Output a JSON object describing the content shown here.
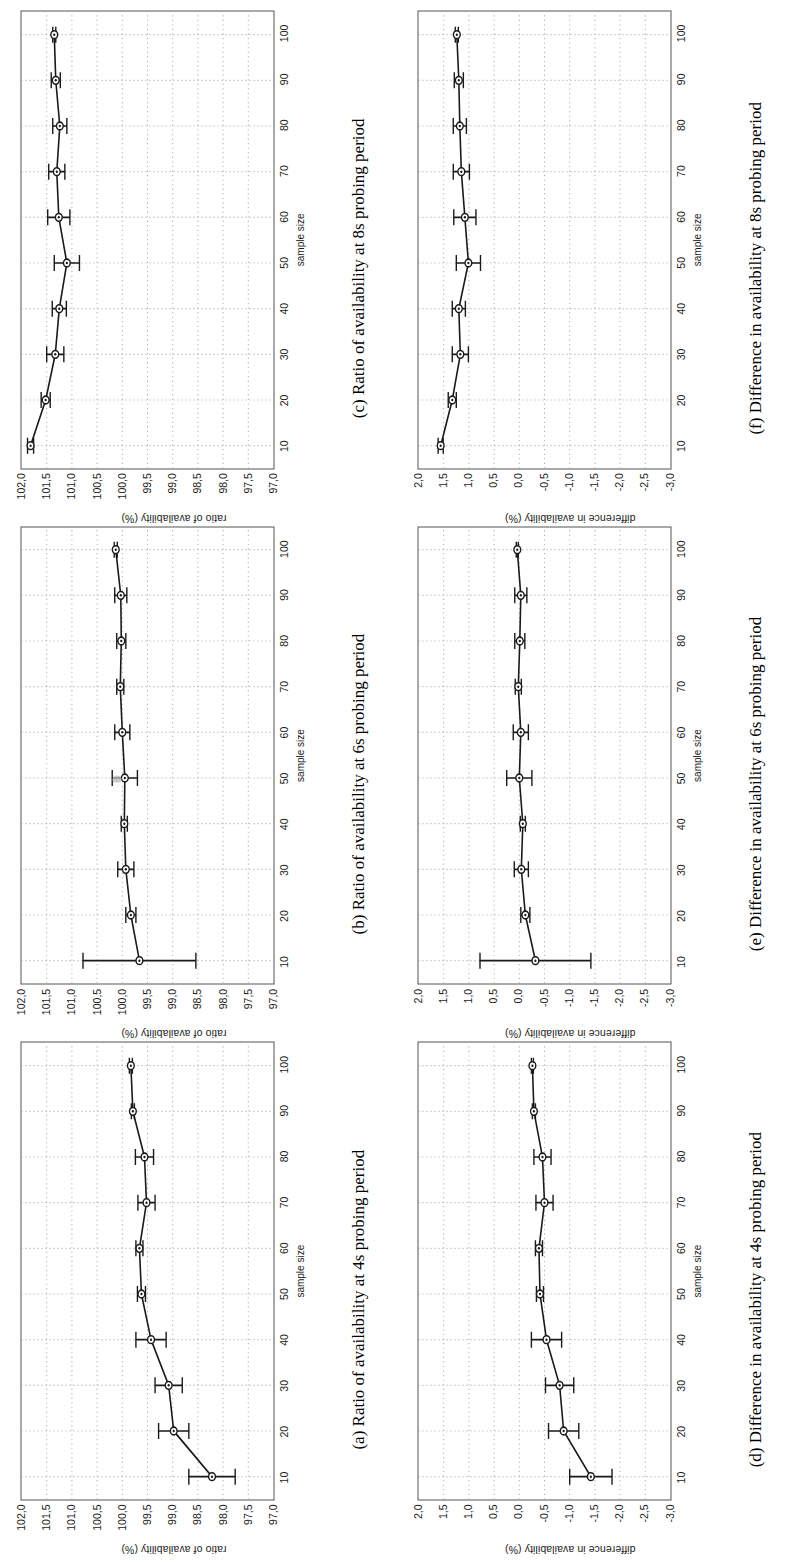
{
  "figure": {
    "rotation_note": "page rotated 90 degrees",
    "xlabel": "sample size",
    "x_ticks": [
      10,
      20,
      30,
      40,
      50,
      60,
      70,
      80,
      90,
      100
    ],
    "ratio_ylabel": "ratio of availability (%)",
    "difference_ylabel": "difference in availability (%)",
    "ratio_y_ticks": [
      "102,0",
      "101,5",
      "101,0",
      "100,5",
      "100,0",
      "99,5",
      "99,0",
      "98,5",
      "98,0",
      "97,5",
      "97,0"
    ],
    "difference_y_ticks": [
      "2,0",
      "1,5",
      "1,0",
      "0,5",
      "0,0",
      "-0,5",
      "-1,0",
      "-1,5",
      "-2,0",
      "-2,5",
      "-3,0"
    ],
    "captions": {
      "a": "(a) Ratio of availability at 4s probing period",
      "b": "(b) Ratio of availability at 6s probing period",
      "c": "(c) Ratio of availability at 8s probing period",
      "d": "(d) Difference in availability at 4s probing period",
      "e": "(e) Difference in availability at 6s probing period",
      "f": "(f) Difference in availability at 8s probing period"
    }
  },
  "chart_data": [
    {
      "id": "a",
      "type": "line",
      "title": "(a) Ratio of availability at 4s probing period",
      "xlabel": "sample size",
      "ylabel": "ratio of availability (%)",
      "xlim": [
        5,
        105
      ],
      "ylim": [
        97.0,
        102.0
      ],
      "grid": true,
      "x": [
        10,
        20,
        30,
        40,
        50,
        60,
        70,
        80,
        90,
        100
      ],
      "values": [
        98.22,
        98.98,
        99.08,
        99.43,
        99.62,
        99.66,
        99.52,
        99.56,
        99.79,
        99.83
      ],
      "errors": [
        0.46,
        0.3,
        0.27,
        0.3,
        0.08,
        0.07,
        0.17,
        0.18,
        0.03,
        0.03
      ]
    },
    {
      "id": "b",
      "type": "line",
      "title": "(b) Ratio of availability at 6s probing period",
      "xlabel": "sample size",
      "ylabel": "ratio of availability (%)",
      "xlim": [
        5,
        105
      ],
      "ylim": [
        97.0,
        102.0
      ],
      "grid": true,
      "x": [
        10,
        20,
        30,
        40,
        50,
        60,
        70,
        80,
        90,
        100
      ],
      "values": [
        99.66,
        99.83,
        99.93,
        99.96,
        99.95,
        100.0,
        100.04,
        100.02,
        100.03,
        100.13
      ],
      "errors": [
        1.12,
        0.1,
        0.16,
        0.06,
        0.25,
        0.15,
        0.07,
        0.09,
        0.12,
        0.03
      ]
    },
    {
      "id": "c",
      "type": "line",
      "title": "(c) Ratio of availability at 8s probing period",
      "xlabel": "sample size",
      "ylabel": "ratio of availability (%)",
      "xlim": [
        5,
        105
      ],
      "ylim": [
        97.0,
        102.0
      ],
      "grid": true,
      "x": [
        10,
        20,
        30,
        40,
        50,
        60,
        70,
        80,
        90,
        100
      ],
      "values": [
        101.82,
        101.52,
        101.33,
        101.25,
        101.1,
        101.26,
        101.3,
        101.24,
        101.32,
        101.35
      ],
      "errors": [
        0.06,
        0.09,
        0.17,
        0.14,
        0.25,
        0.22,
        0.16,
        0.14,
        0.09,
        0.03
      ]
    },
    {
      "id": "d",
      "type": "line",
      "title": "(d) Difference in availability at 4s probing period",
      "xlabel": "sample size",
      "ylabel": "difference in availability (%)",
      "xlim": [
        5,
        105
      ],
      "ylim": [
        -3.0,
        2.0
      ],
      "grid": true,
      "x": [
        10,
        20,
        30,
        40,
        50,
        60,
        70,
        80,
        90,
        100
      ],
      "values": [
        -1.42,
        -0.88,
        -0.8,
        -0.54,
        -0.41,
        -0.39,
        -0.5,
        -0.46,
        -0.29,
        -0.26
      ],
      "errors": [
        0.42,
        0.3,
        0.28,
        0.3,
        0.07,
        0.07,
        0.17,
        0.17,
        0.03,
        0.02
      ]
    },
    {
      "id": "e",
      "type": "line",
      "title": "(e) Difference in availability at 6s probing period",
      "xlabel": "sample size",
      "ylabel": "difference in availability (%)",
      "xlim": [
        5,
        105
      ],
      "ylim": [
        -3.0,
        2.0
      ],
      "grid": true,
      "x": [
        10,
        20,
        30,
        40,
        50,
        60,
        70,
        80,
        90,
        100
      ],
      "values": [
        -0.32,
        -0.12,
        -0.04,
        -0.07,
        0.0,
        -0.03,
        0.02,
        -0.01,
        -0.03,
        0.04
      ],
      "errors": [
        1.1,
        0.09,
        0.14,
        0.05,
        0.25,
        0.15,
        0.06,
        0.1,
        0.12,
        0.02
      ]
    },
    {
      "id": "f",
      "type": "line",
      "title": "(f) Difference in availability at 8s probing period",
      "xlabel": "sample size",
      "ylabel": "difference in availability (%)",
      "xlim": [
        5,
        105
      ],
      "ylim": [
        -3.0,
        2.0
      ],
      "grid": true,
      "x": [
        10,
        20,
        30,
        40,
        50,
        60,
        70,
        80,
        90,
        100
      ],
      "values": [
        1.56,
        1.33,
        1.17,
        1.2,
        1.01,
        1.08,
        1.15,
        1.18,
        1.2,
        1.24
      ],
      "errors": [
        0.05,
        0.08,
        0.16,
        0.13,
        0.24,
        0.22,
        0.16,
        0.13,
        0.09,
        0.03
      ]
    }
  ]
}
